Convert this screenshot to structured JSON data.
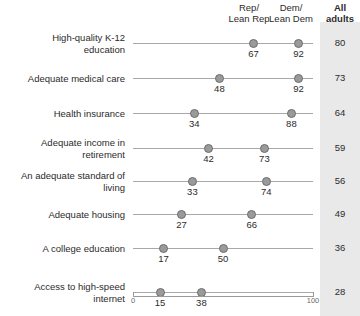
{
  "header": {
    "rep_label": "Rep/\nLean Rep",
    "rep_label_line1": "Rep/",
    "rep_label_line2": "Lean Rep",
    "dem_label_line1": "Dem/",
    "dem_label_line2": "Lean Dem",
    "all_label_line1": "All",
    "all_label_line2": "adults"
  },
  "axis": {
    "min_label": "0",
    "max_label": "100"
  },
  "chart_data": {
    "type": "scatter",
    "title": "",
    "subtitle": "",
    "xlabel": "",
    "ylabel": "",
    "xlim": [
      0,
      100
    ],
    "grid": false,
    "legend_position": "top",
    "orientation": "horizontal-dot-plot",
    "categories": [
      "High-quality K-12 education",
      "Adequate medical care",
      "Health insurance",
      "Adequate income in retirement",
      "An adequate standard of living",
      "Adequate housing",
      "A college education",
      "Access to high-speed internet"
    ],
    "series": [
      {
        "name": "Rep/Lean Rep",
        "values": [
          67,
          48,
          34,
          42,
          33,
          27,
          17,
          15
        ]
      },
      {
        "name": "Dem/Lean Dem",
        "values": [
          92,
          92,
          88,
          73,
          74,
          66,
          50,
          38
        ]
      },
      {
        "name": "All adults",
        "values": [
          80,
          73,
          64,
          59,
          56,
          49,
          36,
          28
        ]
      }
    ],
    "colors": {
      "dot_fill": "#9a9a9a",
      "dot_stroke": "#6d6d6d",
      "connector_line": "#a8a8a8",
      "all_column_background": "#e9e9e9"
    }
  },
  "rows": [
    {
      "label_line1": "High-quality K-12",
      "label_line2": "education",
      "rep": 67,
      "dem": 92,
      "all": 80,
      "rep_text": "67",
      "dem_text": "92",
      "all_text": "80"
    },
    {
      "label_line1": "Adequate medical care",
      "label_line2": "",
      "rep": 48,
      "dem": 92,
      "all": 73,
      "rep_text": "48",
      "dem_text": "92",
      "all_text": "73"
    },
    {
      "label_line1": "Health insurance",
      "label_line2": "",
      "rep": 34,
      "dem": 88,
      "all": 64,
      "rep_text": "34",
      "dem_text": "88",
      "all_text": "64"
    },
    {
      "label_line1": "Adequate income in",
      "label_line2": "retirement",
      "rep": 42,
      "dem": 73,
      "all": 59,
      "rep_text": "42",
      "dem_text": "73",
      "all_text": "59"
    },
    {
      "label_line1": "An adequate standard of",
      "label_line2": "living",
      "rep": 33,
      "dem": 74,
      "all": 56,
      "rep_text": "33",
      "dem_text": "74",
      "all_text": "56"
    },
    {
      "label_line1": "Adequate housing",
      "label_line2": "",
      "rep": 27,
      "dem": 66,
      "all": 49,
      "rep_text": "27",
      "dem_text": "66",
      "all_text": "49"
    },
    {
      "label_line1": "A college education",
      "label_line2": "",
      "rep": 17,
      "dem": 50,
      "all": 36,
      "rep_text": "17",
      "dem_text": "50",
      "all_text": "36"
    },
    {
      "label_line1": "Access to high-speed",
      "label_line2": "internet",
      "rep": 15,
      "dem": 38,
      "all": 28,
      "rep_text": "15",
      "dem_text": "38",
      "all_text": "28"
    }
  ]
}
